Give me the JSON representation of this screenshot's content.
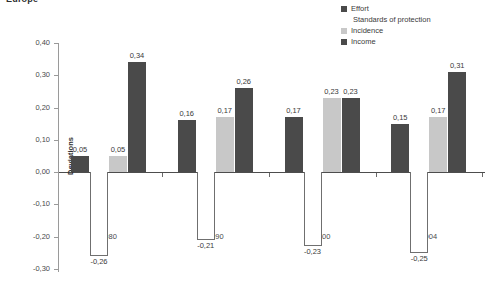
{
  "chart_title": "Europe",
  "axis": {
    "ylabel": "Deviations",
    "ytick_labels": [
      "0,40",
      "0,30",
      "0,20",
      "0,10",
      "0,00",
      "-0,10",
      "-0,20",
      "-0,30"
    ]
  },
  "legend": {
    "items": [
      {
        "label": "Effort",
        "color": "#4a4a4a",
        "swatch": "filled"
      },
      {
        "label": "Standards of protection",
        "color": "#ffffff",
        "swatch": "hollow"
      },
      {
        "label": "Incidence",
        "color": "#c8c8c8",
        "swatch": "filled"
      },
      {
        "label": "Income",
        "color": "#4a4a4a",
        "swatch": "filled"
      }
    ]
  },
  "chart_data": {
    "type": "bar",
    "title": "Europe",
    "xlabel": "",
    "ylabel": "Deviations",
    "ylim": [
      -0.3,
      0.4
    ],
    "ytick_step": 0.1,
    "grid": false,
    "legend_position": "top-right",
    "decimal_separator": ",",
    "categories": [
      "1980",
      "1990",
      "2000",
      "2004"
    ],
    "series": [
      {
        "name": "Effort",
        "color": "#4a4a4a",
        "values": [
          0.05,
          0.16,
          0.17,
          0.15
        ],
        "labels": [
          "0,05",
          "0,16",
          "0,17",
          "0,15"
        ]
      },
      {
        "name": "Standards of protection",
        "color": "#ffffff",
        "values": [
          -0.26,
          -0.21,
          -0.23,
          -0.25
        ],
        "labels": [
          "-0,26",
          "-0,21",
          "-0,23",
          "-0,25"
        ]
      },
      {
        "name": "Incidence",
        "color": "#c8c8c8",
        "values": [
          0.05,
          0.17,
          0.23,
          0.17
        ],
        "labels": [
          "0,05",
          "0,17",
          "0,23",
          "0,17"
        ]
      },
      {
        "name": "Income",
        "color": "#4a4a4a",
        "values": [
          0.34,
          0.26,
          0.23,
          0.31
        ],
        "labels": [
          "0,34",
          "0,26",
          "0,23",
          "0,31"
        ]
      }
    ]
  }
}
